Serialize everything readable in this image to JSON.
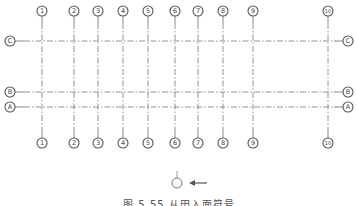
{
  "diagram": {
    "line_color": "#7a7a7a",
    "vertical_axes": [
      {
        "label": "1",
        "x": 42
      },
      {
        "label": "2",
        "x": 74
      },
      {
        "label": "3",
        "x": 98
      },
      {
        "label": "4",
        "x": 123
      },
      {
        "label": "5",
        "x": 148
      },
      {
        "label": "6",
        "x": 175
      },
      {
        "label": "7",
        "x": 198
      },
      {
        "label": "8",
        "x": 223
      },
      {
        "label": "9",
        "x": 253
      },
      {
        "label": "10",
        "x": 328
      }
    ],
    "horizontal_axes": [
      {
        "label": "C",
        "y": 41
      },
      {
        "label": "B",
        "y": 92
      },
      {
        "label": "A",
        "y": 107
      }
    ],
    "top_bubble_y": 11,
    "bottom_bubble_y": 143,
    "left_bubble_x": 10,
    "right_bubble_x": 348,
    "section_symbol": {
      "cx": 177,
      "cy": 183,
      "arrow_from_x": 207,
      "arrow_to_x": 189,
      "direction": "left"
    },
    "caption": "图 5.55  从田入面符号"
  }
}
